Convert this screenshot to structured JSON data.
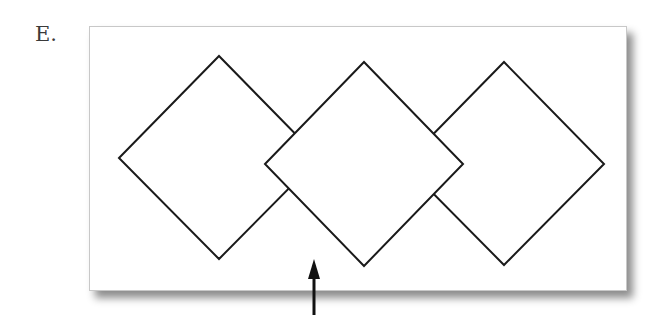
{
  "figure": {
    "label": "E.",
    "frame": {
      "x": 89,
      "y": 26,
      "width": 536,
      "height": 263,
      "background": "#ffffff"
    },
    "diamonds": [
      {
        "name": "left",
        "points": "119,158 219,56 319,158 219,259",
        "layer": "back"
      },
      {
        "name": "right",
        "points": "463,164 504,62 604,164 504,265",
        "layer": "back"
      },
      {
        "name": "middle",
        "points": "265,164 364,62 463,164 364,266",
        "layer": "front"
      }
    ],
    "arrow": {
      "x": 314,
      "tip_y": 260,
      "tail_y": 315,
      "direction": "up"
    },
    "stroke_color": "#1a1a1a"
  }
}
